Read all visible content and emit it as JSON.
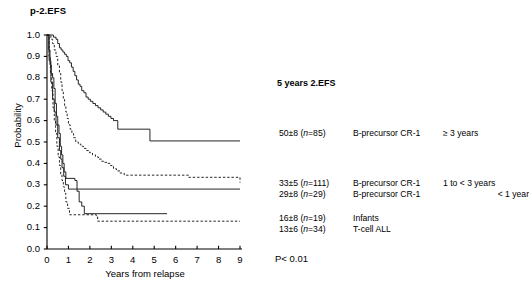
{
  "figure": {
    "title": "p-2.EFS",
    "pvalue": "P< 0.01",
    "legend_title": "5 years 2.EFS"
  },
  "chart_data": {
    "type": "line",
    "title": "p-2.EFS",
    "subtitle": "",
    "xlabel": "Years from relapse",
    "ylabel": "Probability",
    "xlim": [
      0,
      9
    ],
    "ylim": [
      0.0,
      1.0
    ],
    "xticks": [
      "0",
      "1",
      "2",
      "3",
      "4",
      "5",
      "6",
      "7",
      "8",
      "9"
    ],
    "yticks": [
      "0.0",
      "0.1",
      "0.2",
      "0.3",
      "0.4",
      "0.5",
      "0.6",
      "0.7",
      "0.8",
      "0.9",
      "1.0"
    ],
    "grid": false,
    "legend_position": "right",
    "annotations": [
      "5 years 2.EFS",
      "P< 0.01"
    ],
    "series": [
      {
        "name": "B-precursor CR-1  ≥ 3 years",
        "estimate": "50±8",
        "n": "(n=85)",
        "group": "B-precursor CR-1",
        "duration": "≥ 3 years",
        "style": "solid",
        "plateau": 0.5,
        "steps": [
          [
            0.0,
            1.0
          ],
          [
            0.3,
            0.99
          ],
          [
            0.42,
            0.98
          ],
          [
            0.5,
            0.96
          ],
          [
            0.58,
            0.94
          ],
          [
            0.66,
            0.93
          ],
          [
            0.74,
            0.92
          ],
          [
            0.82,
            0.91
          ],
          [
            0.9,
            0.9
          ],
          [
            0.98,
            0.88
          ],
          [
            1.06,
            0.87
          ],
          [
            1.14,
            0.85
          ],
          [
            1.22,
            0.83
          ],
          [
            1.3,
            0.81
          ],
          [
            1.38,
            0.79
          ],
          [
            1.46,
            0.77
          ],
          [
            1.54,
            0.76
          ],
          [
            1.62,
            0.74
          ],
          [
            1.72,
            0.73
          ],
          [
            1.82,
            0.71
          ],
          [
            1.92,
            0.7
          ],
          [
            2.02,
            0.69
          ],
          [
            2.14,
            0.68
          ],
          [
            2.26,
            0.67
          ],
          [
            2.38,
            0.66
          ],
          [
            2.5,
            0.65
          ],
          [
            2.62,
            0.64
          ],
          [
            2.74,
            0.63
          ],
          [
            2.86,
            0.62
          ],
          [
            2.98,
            0.61
          ],
          [
            3.1,
            0.6
          ],
          [
            3.3,
            0.56
          ],
          [
            4.8,
            0.505
          ],
          [
            9.0,
            0.505
          ]
        ]
      },
      {
        "name": "B-precursor CR-1  1 to < 3 years",
        "estimate": "33±5",
        "n": "(n=111)",
        "group": "B-precursor CR-1",
        "duration": "1 to < 3 years",
        "style": "dashed",
        "plateau": 0.33,
        "steps": [
          [
            0.0,
            1.0
          ],
          [
            0.18,
            0.98
          ],
          [
            0.26,
            0.96
          ],
          [
            0.34,
            0.93
          ],
          [
            0.42,
            0.9
          ],
          [
            0.5,
            0.86
          ],
          [
            0.58,
            0.82
          ],
          [
            0.64,
            0.78
          ],
          [
            0.7,
            0.74
          ],
          [
            0.76,
            0.7
          ],
          [
            0.82,
            0.67
          ],
          [
            0.88,
            0.64
          ],
          [
            0.94,
            0.61
          ],
          [
            1.0,
            0.58
          ],
          [
            1.08,
            0.56
          ],
          [
            1.16,
            0.54
          ],
          [
            1.24,
            0.52
          ],
          [
            1.34,
            0.5
          ],
          [
            1.46,
            0.49
          ],
          [
            1.58,
            0.48
          ],
          [
            1.7,
            0.47
          ],
          [
            1.84,
            0.46
          ],
          [
            1.98,
            0.45
          ],
          [
            2.12,
            0.44
          ],
          [
            2.26,
            0.43
          ],
          [
            2.4,
            0.42
          ],
          [
            2.54,
            0.41
          ],
          [
            2.68,
            0.405
          ],
          [
            2.82,
            0.4
          ],
          [
            2.96,
            0.39
          ],
          [
            3.1,
            0.375
          ],
          [
            3.24,
            0.365
          ],
          [
            3.4,
            0.355
          ],
          [
            3.6,
            0.345
          ],
          [
            6.6,
            0.335
          ],
          [
            9.0,
            0.31
          ]
        ]
      },
      {
        "name": "B-precursor CR-1  < 1 year",
        "estimate": "29±8",
        "n": "(n=29)",
        "group": "B-precursor CR-1",
        "duration": "< 1 year",
        "style": "solid",
        "plateau": 0.29,
        "steps": [
          [
            0.0,
            1.0
          ],
          [
            0.08,
            0.93
          ],
          [
            0.14,
            0.86
          ],
          [
            0.2,
            0.82
          ],
          [
            0.26,
            0.8
          ],
          [
            0.32,
            0.75
          ],
          [
            0.38,
            0.68
          ],
          [
            0.44,
            0.62
          ],
          [
            0.5,
            0.58
          ],
          [
            0.56,
            0.54
          ],
          [
            0.62,
            0.48
          ],
          [
            0.68,
            0.44
          ],
          [
            0.74,
            0.4
          ],
          [
            0.8,
            0.36
          ],
          [
            0.88,
            0.33
          ],
          [
            1.3,
            0.32
          ],
          [
            1.4,
            0.28
          ],
          [
            9.0,
            0.28
          ]
        ]
      },
      {
        "name": "Infants",
        "estimate": "16±8",
        "n": "(n=19)",
        "group": "Infants",
        "duration": "",
        "style": "solid",
        "plateau": 0.16,
        "steps": [
          [
            0.0,
            1.0
          ],
          [
            0.1,
            0.88
          ],
          [
            0.18,
            0.78
          ],
          [
            0.26,
            0.7
          ],
          [
            0.34,
            0.64
          ],
          [
            0.42,
            0.58
          ],
          [
            0.5,
            0.52
          ],
          [
            0.58,
            0.46
          ],
          [
            0.64,
            0.42
          ],
          [
            0.7,
            0.38
          ],
          [
            0.78,
            0.34
          ],
          [
            0.86,
            0.3
          ],
          [
            1.0,
            0.28
          ],
          [
            1.4,
            0.27
          ],
          [
            1.5,
            0.22
          ],
          [
            1.62,
            0.2
          ],
          [
            1.74,
            0.165
          ],
          [
            5.6,
            0.165
          ]
        ]
      },
      {
        "name": "T-cell ALL",
        "estimate": "13±6",
        "n": "(n=34)",
        "group": "T-cell ALL",
        "duration": "",
        "style": "dashed",
        "plateau": 0.13,
        "steps": [
          [
            0.0,
            1.0
          ],
          [
            0.1,
            0.9
          ],
          [
            0.16,
            0.82
          ],
          [
            0.22,
            0.74
          ],
          [
            0.28,
            0.66
          ],
          [
            0.34,
            0.6
          ],
          [
            0.4,
            0.54
          ],
          [
            0.46,
            0.48
          ],
          [
            0.52,
            0.43
          ],
          [
            0.58,
            0.39
          ],
          [
            0.64,
            0.35
          ],
          [
            0.7,
            0.32
          ],
          [
            0.76,
            0.29
          ],
          [
            0.82,
            0.26
          ],
          [
            0.88,
            0.22
          ],
          [
            0.96,
            0.19
          ],
          [
            1.05,
            0.16
          ],
          [
            2.3,
            0.155
          ],
          [
            2.36,
            0.13
          ],
          [
            9.0,
            0.13
          ]
        ]
      }
    ]
  },
  "legend_rows": [
    {
      "estimate": "50±8",
      "n": "(n=85)",
      "group": "B-precursor CR-1",
      "duration": "≥ 3 years",
      "align": "left"
    },
    {
      "estimate": "33±5",
      "n": "(n=111)",
      "group": "B-precursor CR-1",
      "duration": "1 to < 3 years",
      "align": "left"
    },
    {
      "estimate": "29±8",
      "n": "(n=29)",
      "group": "B-precursor CR-1",
      "duration": "< 1 year",
      "align": "right"
    },
    {
      "estimate": "16±8",
      "n": "(n=19)",
      "group": "Infants",
      "duration": "",
      "align": "left"
    },
    {
      "estimate": "13±6",
      "n": "(n=34)",
      "group": "T-cell ALL",
      "duration": "",
      "align": "left"
    }
  ],
  "colors": {
    "axis": "#000000",
    "curve": "#1a1a1a",
    "background": "#ffffff"
  }
}
